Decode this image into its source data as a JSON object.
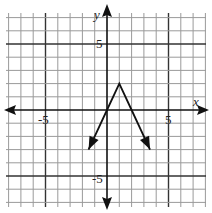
{
  "chart_data": {
    "type": "line",
    "title": "",
    "xlabel": "x",
    "ylabel": "y",
    "xlim": [
      -8,
      8
    ],
    "ylim": [
      -7,
      8
    ],
    "grid": true,
    "tick_labels": {
      "x": [
        "-5",
        "5"
      ],
      "y": [
        "5",
        "-5"
      ]
    },
    "series": [
      {
        "name": "f(x) = -2|x - 1| + 2",
        "x": [
          -1.5,
          0,
          1,
          2,
          3.5
        ],
        "y": [
          -3,
          0,
          2,
          0,
          -3
        ],
        "vertex": [
          1,
          2
        ],
        "arrows_at_ends": true
      }
    ]
  },
  "labels": {
    "x_axis": "x",
    "y_axis": "y",
    "x_neg5": "-5",
    "x_pos5": "5",
    "y_pos5": "5",
    "y_neg5": "-5"
  },
  "colors": {
    "grid": "#9a9a9a",
    "axis": "#111111",
    "curve": "#111111"
  }
}
